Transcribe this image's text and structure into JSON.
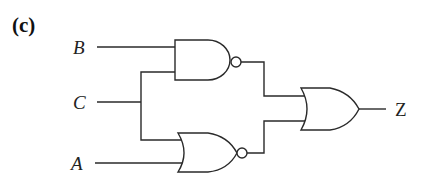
{
  "figure": {
    "part_label": "(c)",
    "inputs": [
      {
        "name": "B",
        "y": 47
      },
      {
        "name": "C",
        "y": 102
      },
      {
        "name": "A",
        "y": 163
      }
    ],
    "output": {
      "name": "Z"
    },
    "gates": [
      {
        "type": "NAND",
        "inputs": [
          "B",
          "C"
        ]
      },
      {
        "type": "NOR",
        "inputs": [
          "C",
          "A"
        ]
      },
      {
        "type": "OR",
        "inputs": [
          "NAND",
          "NOR"
        ],
        "output": "Z"
      }
    ],
    "colors": {
      "line": "#2a2a2a",
      "background": "#ffffff"
    }
  }
}
